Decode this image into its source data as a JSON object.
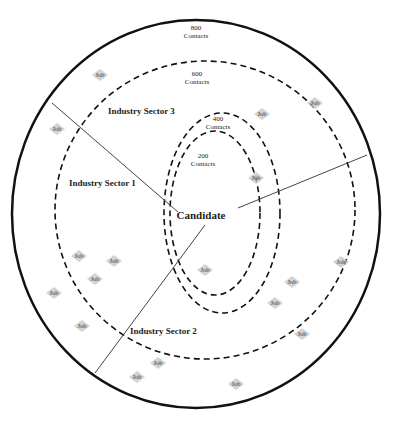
{
  "diagram": {
    "center_label": "Candidate",
    "rings": [
      {
        "value": "200",
        "unit": "Contacts"
      },
      {
        "value": "400",
        "unit": "Contacts"
      },
      {
        "value": "600",
        "unit": "Contacts"
      },
      {
        "value": "800",
        "unit": "Contacts"
      }
    ],
    "sectors": [
      {
        "label": "Industry Sector 1"
      },
      {
        "label": "Industry Sector 2"
      },
      {
        "label": "Industry Sector 3"
      }
    ],
    "job_label": "Job",
    "jobs": [
      {
        "x": 100,
        "y": 75
      },
      {
        "x": 57,
        "y": 129
      },
      {
        "x": 262,
        "y": 114
      },
      {
        "x": 315,
        "y": 103
      },
      {
        "x": 256,
        "y": 178
      },
      {
        "x": 79,
        "y": 256
      },
      {
        "x": 114,
        "y": 261
      },
      {
        "x": 95,
        "y": 279
      },
      {
        "x": 54,
        "y": 293
      },
      {
        "x": 82,
        "y": 326
      },
      {
        "x": 205,
        "y": 270
      },
      {
        "x": 292,
        "y": 282
      },
      {
        "x": 275,
        "y": 303
      },
      {
        "x": 341,
        "y": 262
      },
      {
        "x": 302,
        "y": 334
      },
      {
        "x": 158,
        "y": 363
      },
      {
        "x": 137,
        "y": 377
      },
      {
        "x": 236,
        "y": 384
      }
    ],
    "colors": {
      "outline": "#111111",
      "divider": "#444444",
      "job_fill": "#c8c8c8"
    }
  }
}
